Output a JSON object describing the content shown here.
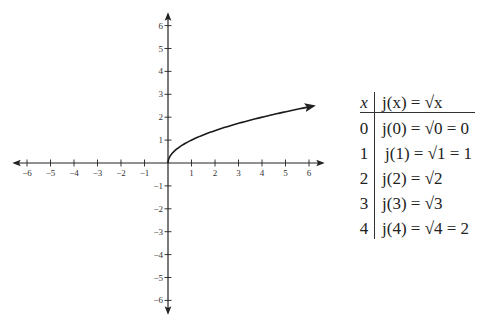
{
  "chart_data": {
    "type": "line",
    "title": "",
    "xlabel": "",
    "ylabel": "",
    "function": "j(x) = sqrt(x)",
    "xlim": [
      -6.5,
      6.5
    ],
    "ylim": [
      -6.5,
      6.5
    ],
    "x_ticks": [
      -6,
      -5,
      -4,
      -3,
      -2,
      -1,
      1,
      2,
      3,
      4,
      5,
      6
    ],
    "y_ticks": [
      -6,
      -5,
      -4,
      -3,
      -2,
      -1,
      1,
      2,
      3,
      4,
      5,
      6
    ],
    "grid": false,
    "series": [
      {
        "name": "j(x) = √x",
        "x": [
          0,
          0.25,
          0.5,
          1,
          1.5,
          2,
          3,
          4,
          5,
          6.2
        ],
        "y": [
          0,
          0.5,
          0.707,
          1,
          1.225,
          1.414,
          1.732,
          2,
          2.236,
          2.49
        ],
        "end_arrow": true
      }
    ],
    "table": {
      "headers": [
        "x",
        "j(x) = √x"
      ],
      "rows": [
        [
          "0",
          "j(0) = √0 = 0"
        ],
        [
          "1",
          "j(1) = √1 = 1"
        ],
        [
          "2",
          "j(2) = √2"
        ],
        [
          "3",
          "j(3) = √3"
        ],
        [
          "4",
          "j(4) = √4 = 2"
        ]
      ]
    }
  },
  "axis_labels": {
    "x": [
      "−6",
      "−5",
      "−4",
      "−3",
      "−2",
      "−1",
      "1",
      "2",
      "3",
      "4",
      "5",
      "6"
    ],
    "y": [
      "6",
      "5",
      "4",
      "3",
      "2",
      "1",
      "−1",
      "−2",
      "−3",
      "−4",
      "−5",
      "−6"
    ]
  },
  "table": {
    "header_x": "x",
    "header_fn": "j(x) = √x",
    "rows": [
      {
        "x": "0",
        "expr": "j(0) = √0 = 0"
      },
      {
        "x": "1",
        "expr": "j(1) = √1 = 1"
      },
      {
        "x": "2",
        "expr": "j(2) = √2"
      },
      {
        "x": "3",
        "expr": "j(3) = √3"
      },
      {
        "x": "4",
        "expr": "j(4) = √4 = 2"
      }
    ]
  },
  "colors": {
    "axis": "#222222",
    "curve": "#1a1a1a",
    "text": "#222222"
  }
}
